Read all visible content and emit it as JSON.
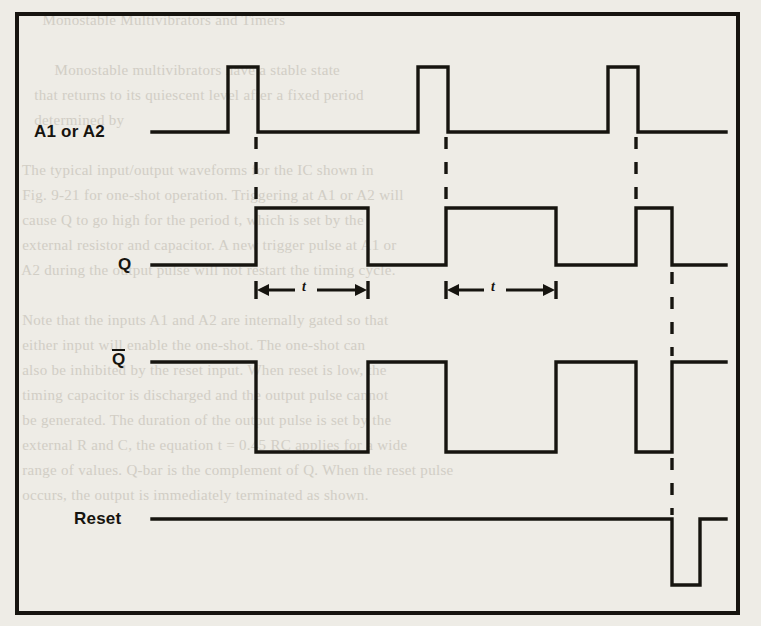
{
  "figure": {
    "kind": "digital-timing-diagram",
    "background_color": "#eeece6",
    "ink_color": "#16140f",
    "frame": {
      "x": 15,
      "y": 12,
      "width": 725,
      "height": 603,
      "border_px": 4
    }
  },
  "signals": [
    {
      "id": "a1-or-a2",
      "label": "A1 or A2",
      "label_x": 34,
      "label_y": 122,
      "row_low_y": 132,
      "row_high_y": 67,
      "start_x": 152,
      "end_x": 726,
      "pulse_polarity": "positive",
      "edges_x": [
        [
          228,
          258
        ],
        [
          418,
          448
        ],
        [
          608,
          638
        ]
      ]
    },
    {
      "id": "q",
      "label": "Q",
      "label_x": 118,
      "label_y": 255,
      "row_low_y": 265,
      "row_high_y": 208,
      "start_x": 152,
      "end_x": 726,
      "pulse_polarity": "positive",
      "edges_x": [
        [
          256,
          368
        ],
        [
          446,
          556
        ],
        [
          636,
          672
        ]
      ]
    },
    {
      "id": "q-bar",
      "label": "Q",
      "overline": true,
      "label_x": 112,
      "label_y": 352,
      "row_low_y": 452,
      "row_high_y": 362,
      "start_x": 152,
      "end_x": 726,
      "pulse_polarity": "negative",
      "edges_x": [
        [
          256,
          368
        ],
        [
          446,
          556
        ],
        [
          636,
          672
        ]
      ]
    },
    {
      "id": "reset",
      "label": "Reset",
      "label_x": 74,
      "label_y": 509,
      "row_low_y": 585,
      "row_high_y": 519,
      "start_x": 152,
      "end_x": 726,
      "pulse_polarity": "negative",
      "edges_x": [
        [
          672,
          700
        ]
      ]
    }
  ],
  "dashed_guides": [
    {
      "id": "guide-pulse-1",
      "x": 256,
      "y1": 137,
      "y2": 205
    },
    {
      "id": "guide-pulse-2",
      "x": 446,
      "y1": 137,
      "y2": 205
    },
    {
      "id": "guide-pulse-3",
      "x": 636,
      "y1": 137,
      "y2": 205
    },
    {
      "id": "guide-reset-upper",
      "x": 672,
      "y1": 272,
      "y2": 356
    },
    {
      "id": "guide-reset-lower",
      "x": 672,
      "y1": 458,
      "y2": 515
    }
  ],
  "dimensions": [
    {
      "id": "t-interval-1",
      "label": "t",
      "x1": 256,
      "x2": 368,
      "y": 290,
      "label_x": 306,
      "label_y": 281
    },
    {
      "id": "t-interval-2",
      "label": "t",
      "x1": 446,
      "x2": 556,
      "y": 290,
      "label_x": 495,
      "label_y": 281
    }
  ],
  "bleed_through_text": "        Monostable Multivibrators and Timers\n\n           Monostable multivibrators have a stable state\n      that returns to its quiescent level after a fixed period\n      determined by\n\n   The typical input/output waveforms for the IC shown in\n   Fig. 9-21 for one-shot operation. Triggering at A1 or A2 will\n   cause Q to go high for the period t, which is set by the\n   external resistor and capacitor. A new trigger pulse at A1 or\n   A2 during the output pulse will not restart the timing cycle.\n\n   Note that the inputs A1 and A2 are internally gated so that\n   either input will enable the one-shot. The one-shot can\n   also be inhibited by the reset input. When reset is low, the\n   timing capacitor is discharged and the output pulse cannot\n   be generated. The duration of the output pulse is set by the\n   external R and C, the equation t = 0.45 RC applies for a wide\n   range of values. Q-bar is the complement of Q. When the reset pulse\n   occurs, the output is immediately terminated as shown."
}
